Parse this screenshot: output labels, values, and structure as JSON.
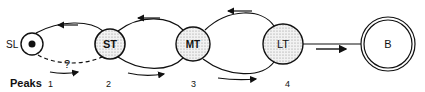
{
  "nodes": [
    {
      "id": "SL",
      "label": "SL",
      "cx": 32,
      "cy": 44,
      "r": 11,
      "style": "dot"
    },
    {
      "id": "ST",
      "label": "ST",
      "cx": 110,
      "cy": 44,
      "r": 15,
      "style": "stippled"
    },
    {
      "id": "MT",
      "label": "MT",
      "cx": 193,
      "cy": 44,
      "r": 17,
      "style": "stippled"
    },
    {
      "id": "LT",
      "label": "LT",
      "cx": 283,
      "cy": 44,
      "r": 20,
      "style": "stippled"
    },
    {
      "id": "B",
      "label": "B",
      "cx": 388,
      "cy": 44,
      "r": 27,
      "style": "double"
    }
  ],
  "unknown_link_label": "?",
  "peaks": {
    "title": "Peaks",
    "labels": [
      "1",
      "2",
      "3",
      "4"
    ]
  }
}
